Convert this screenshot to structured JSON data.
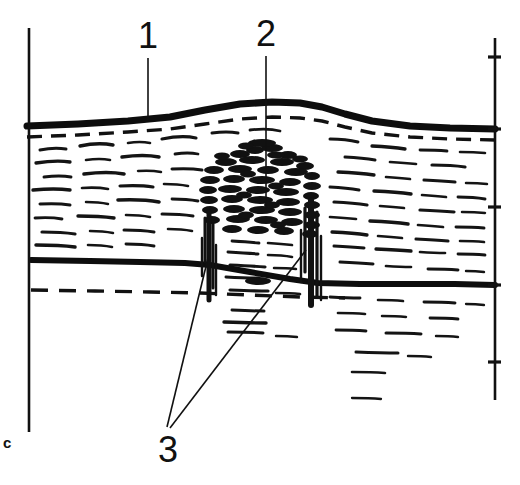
{
  "figure": {
    "panel_label": "c",
    "kind": "ultrasound-schematic-line-drawing",
    "background_color": "#ffffff",
    "ink_color": "#111111",
    "width": 520,
    "height": 485
  },
  "callouts": [
    {
      "id": "callout-1",
      "label": "1",
      "label_x": 148,
      "label_y": 48,
      "leader": [
        [
          148,
          58
        ],
        [
          148,
          120
        ]
      ],
      "points_to": "skin-boundary-line"
    },
    {
      "id": "callout-2",
      "label": "2",
      "label_x": 266,
      "label_y": 46,
      "leader": [
        [
          266,
          56
        ],
        [
          266,
          210
        ]
      ],
      "points_to": "hyperechoic-mass"
    },
    {
      "id": "callout-3",
      "label": "3",
      "label_x": 168,
      "label_y": 462,
      "leader_a": [
        [
          208,
          258
        ],
        [
          167,
          427
        ]
      ],
      "leader_b": [
        [
          306,
          250
        ],
        [
          170,
          428
        ]
      ],
      "points_to": "acoustic-shadow-streaks"
    }
  ],
  "axes": {
    "left": {
      "x": 29,
      "y1": 28,
      "y2": 432
    },
    "right": {
      "x": 495,
      "y1": 38,
      "y2": 400
    },
    "right_ticks": [
      {
        "y": 57,
        "length": 13
      },
      {
        "y": 129,
        "length": 13
      },
      {
        "y": 207,
        "length": 13
      },
      {
        "y": 285,
        "length": 13
      },
      {
        "y": 362,
        "length": 13
      }
    ]
  },
  "structures": {
    "skin_line": {
      "name": "skin-boundary-line",
      "path": "M 27 126 L 78 124 L 128 121 L 170 117 L 205 110 L 240 104 L 272 102 L 300 103 L 322 107 L 345 114 L 372 121 L 410 126 L 450 128 L 495 129"
    },
    "subdermal_dashes": {
      "name": "subdermal-dashed-layer",
      "path": "M 27 137 L 78 135 L 128 132 L 170 129 L 205 124 L 240 119 L 272 117 L 300 118 L 322 121 L 345 127 L 372 133 L 410 137 L 450 139 L 495 140",
      "dasharray": "15 9"
    },
    "fascia_line": {
      "name": "deep-fascia-line",
      "path": "M 31 260 L 90 261 L 140 262 L 185 263 L 210 265 L 250 272 L 290 279 L 318 283 L 360 284 L 410 284 L 455 284 L 495 285"
    },
    "lower_dashes": {
      "name": "lower-dashed-layer",
      "path": "M 31 290 L 95 291 L 150 292 L 200 293 L 250 295 L 300 297 L 345 298",
      "dasharray": "17 11"
    },
    "mass": {
      "name": "hyperechoic-mass",
      "description": "dome-shaped dense speckled lesion",
      "top_y": 143,
      "bottom_y": 232,
      "left_x": 206,
      "right_x": 318,
      "apex_x": 262
    },
    "shadow_left": {
      "name": "acoustic-shadow-left",
      "x": 209,
      "y1": 210,
      "y2": 300
    },
    "shadow_right": {
      "name": "acoustic-shadow-right",
      "x": 311,
      "y1": 200,
      "y2": 305
    }
  }
}
